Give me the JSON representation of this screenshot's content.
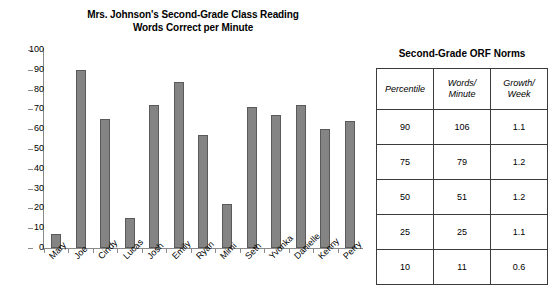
{
  "chart_data": {
    "type": "bar",
    "title": "Mrs. Johnson's Second-Grade Class Reading Words Correct per Minute",
    "title_lines": [
      "Mrs. Johnson's Second-Grade Class Reading",
      "Words Correct per Minute"
    ],
    "xlabel": "",
    "ylabel": "",
    "ylim": [
      0,
      100
    ],
    "ytick_step": 10,
    "yticks": [
      100,
      90,
      80,
      70,
      60,
      50,
      40,
      30,
      20,
      10,
      0
    ],
    "grid": false,
    "legend": null,
    "bar_color": "#848484",
    "bar_edge_color": "#5a5a5a",
    "categories": [
      "Mary",
      "Joe",
      "Cindy",
      "Lucas",
      "Josh",
      "Emily",
      "Ryan",
      "Mimi",
      "Seth",
      "Yvonka",
      "Danielle",
      "Kenny",
      "Perry"
    ],
    "values": [
      7,
      90,
      65,
      15,
      72,
      84,
      57,
      22,
      71,
      67,
      72,
      60,
      64
    ]
  },
  "chart": {
    "title_line_1": "Mrs. Johnson's Second-Grade Class Reading",
    "title_line_2": "Words Correct per Minute"
  },
  "table": {
    "title": "Second-Grade ORF Norms",
    "columns": [
      {
        "line1": "Percentile",
        "line2": ""
      },
      {
        "line1": "Words/",
        "line2": "Minute"
      },
      {
        "line1": "Growth/",
        "line2": "Week"
      }
    ],
    "rows": [
      {
        "percentile": "90",
        "words_per_minute": "106",
        "growth_per_week": "1.1"
      },
      {
        "percentile": "75",
        "words_per_minute": "79",
        "growth_per_week": "1.2"
      },
      {
        "percentile": "50",
        "words_per_minute": "51",
        "growth_per_week": "1.2"
      },
      {
        "percentile": "25",
        "words_per_minute": "25",
        "growth_per_week": "1.1"
      },
      {
        "percentile": "10",
        "words_per_minute": "11",
        "growth_per_week": "0.6"
      }
    ]
  }
}
